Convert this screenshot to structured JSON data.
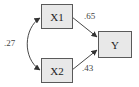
{
  "diagram": {
    "type": "path-diagram",
    "nodes": [
      {
        "id": "X1",
        "label": "X1",
        "x": 41,
        "y": 4,
        "w": 31,
        "h": 24
      },
      {
        "id": "X2",
        "label": "X2",
        "x": 41,
        "y": 58,
        "w": 31,
        "h": 24
      },
      {
        "id": "Y",
        "label": "Y",
        "x": 98,
        "y": 31,
        "w": 33,
        "h": 26
      }
    ],
    "edges": [
      {
        "from": "X1",
        "to": "Y",
        "label": ".65",
        "kind": "directed"
      },
      {
        "from": "X2",
        "to": "Y",
        "label": ".43",
        "kind": "directed"
      },
      {
        "from": "X1",
        "to": "X2",
        "label": ".27",
        "kind": "bidirectional-curved"
      }
    ],
    "colors": {
      "node_fill": "#e8e8e8",
      "node_stroke": "#5a5a5a",
      "edge": "#333333",
      "text": "#222222"
    }
  }
}
